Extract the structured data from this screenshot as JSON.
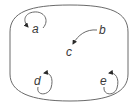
{
  "diagram": {
    "container": {
      "shape": "rounded-barrel",
      "stroke": "#6a6a6a"
    },
    "nodes": [
      {
        "id": "a",
        "label": "a",
        "self_loop": true
      },
      {
        "id": "b",
        "label": "b",
        "self_loop": false
      },
      {
        "id": "c",
        "label": "c",
        "self_loop": false
      },
      {
        "id": "d",
        "label": "d",
        "self_loop": true
      },
      {
        "id": "e",
        "label": "e",
        "self_loop": true
      }
    ],
    "edges": [
      {
        "from": "a",
        "to": "a"
      },
      {
        "from": "b",
        "to": "c"
      },
      {
        "from": "d",
        "to": "d"
      },
      {
        "from": "e",
        "to": "e"
      }
    ],
    "colors": {
      "stroke": "#6a6a6a",
      "text": "#3a3a3a",
      "arrowhead": "#2a2a2a"
    }
  }
}
